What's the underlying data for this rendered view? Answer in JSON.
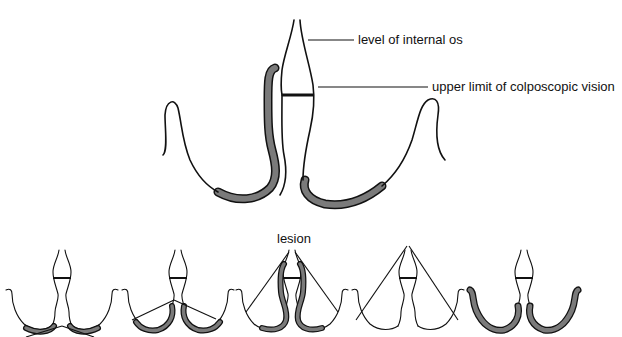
{
  "figure": {
    "type": "anatomical diagram - cervix cross-section with colposcopic view",
    "colors": {
      "outline": "#111111",
      "lesion_fill": "#7a7a7a",
      "background": "#ffffff"
    },
    "main_diagram": {
      "labels": {
        "internal_os": "level of internal os",
        "colposcopic_limit": "upper limit of colposcopic vision"
      }
    },
    "small_diagrams": {
      "lesion_label": "lesion",
      "count": 5,
      "items": [
        {
          "index": 1,
          "description": "lesion confined to ectocervix, fully visible (shallow view)"
        },
        {
          "index": 2,
          "description": "lesion extending slightly into canal, visible"
        },
        {
          "index": 3,
          "description": "lesion extending high into endocervical canal",
          "label": "lesion"
        },
        {
          "index": 4,
          "description": "no lesion, view lines into canal"
        },
        {
          "index": 5,
          "description": "lesion covering entire ectocervix"
        }
      ]
    }
  }
}
